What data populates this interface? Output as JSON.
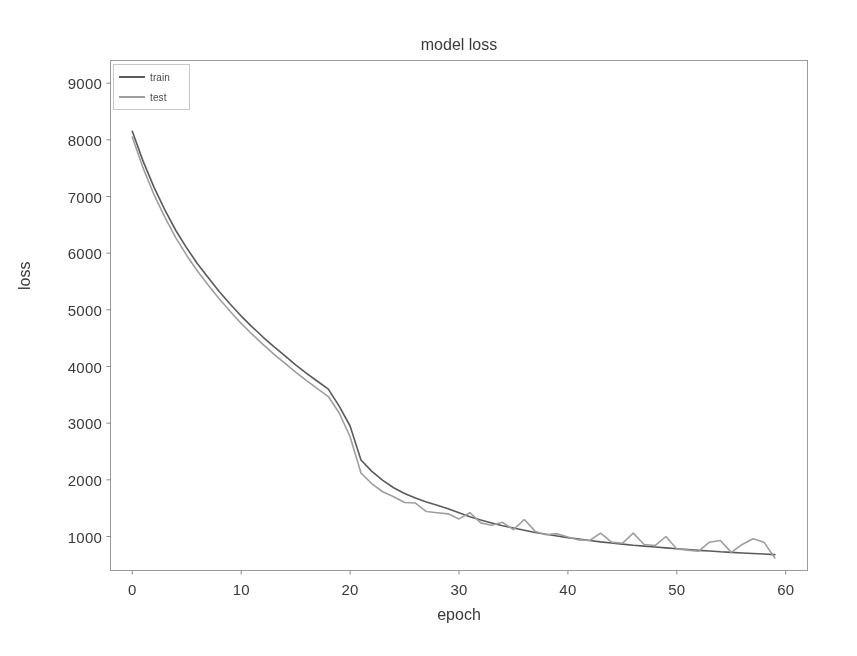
{
  "chart_data": {
    "type": "line",
    "title": "model loss",
    "xlabel": "epoch",
    "ylabel": "loss",
    "xlim": [
      -2,
      62
    ],
    "ylim": [
      400,
      9400
    ],
    "xticks": [
      0,
      10,
      20,
      30,
      40,
      50,
      60
    ],
    "yticks": [
      1000,
      2000,
      3000,
      4000,
      5000,
      6000,
      7000,
      8000,
      9000
    ],
    "grid": false,
    "legend_position": "upper left",
    "x": [
      0,
      1,
      2,
      3,
      4,
      5,
      6,
      7,
      8,
      9,
      10,
      11,
      12,
      13,
      14,
      15,
      16,
      17,
      18,
      19,
      20,
      21,
      22,
      23,
      24,
      25,
      26,
      27,
      28,
      29,
      30,
      31,
      32,
      33,
      34,
      35,
      36,
      37,
      38,
      39,
      40,
      41,
      42,
      43,
      44,
      45,
      46,
      47,
      48,
      49,
      50,
      51,
      52,
      53,
      54,
      55,
      56,
      57,
      58,
      59
    ],
    "series": [
      {
        "name": "train",
        "color": "#5a5a5a",
        "values": [
          8150,
          7620,
          7160,
          6760,
          6400,
          6090,
          5810,
          5560,
          5320,
          5100,
          4890,
          4700,
          4520,
          4350,
          4190,
          4030,
          3880,
          3740,
          3600,
          3300,
          2950,
          2350,
          2150,
          1990,
          1860,
          1760,
          1680,
          1610,
          1550,
          1490,
          1420,
          1350,
          1290,
          1240,
          1190,
          1150,
          1110,
          1070,
          1040,
          1010,
          980,
          955,
          930,
          905,
          885,
          865,
          845,
          830,
          815,
          800,
          785,
          770,
          755,
          745,
          730,
          720,
          710,
          700,
          690,
          680
        ]
      },
      {
        "name": "test",
        "color": "#9e9e9e",
        "values": [
          8050,
          7500,
          7030,
          6630,
          6270,
          5960,
          5680,
          5430,
          5190,
          4970,
          4760,
          4570,
          4390,
          4220,
          4060,
          3900,
          3750,
          3610,
          3470,
          3180,
          2760,
          2120,
          1930,
          1790,
          1700,
          1600,
          1590,
          1440,
          1420,
          1400,
          1310,
          1420,
          1240,
          1200,
          1250,
          1120,
          1300,
          1090,
          1030,
          1050,
          990,
          940,
          930,
          1060,
          900,
          880,
          1060,
          860,
          840,
          1000,
          780,
          760,
          740,
          900,
          930,
          720,
          860,
          960,
          900,
          620
        ]
      }
    ]
  },
  "legend": {
    "items": [
      {
        "label": "train",
        "color": "#5a5a5a"
      },
      {
        "label": "test",
        "color": "#9e9e9e"
      }
    ]
  },
  "axes": {
    "ytick_labels": [
      "9000",
      "8000",
      "7000",
      "6000",
      "5000",
      "4000",
      "3000",
      "2000",
      "1000"
    ],
    "xtick_labels": [
      "0",
      "10",
      "20",
      "30",
      "40",
      "50",
      "60"
    ]
  }
}
